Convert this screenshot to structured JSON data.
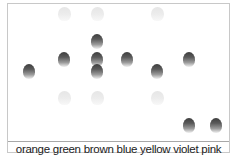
{
  "columns": [
    {
      "label": "orange",
      "x": 29
    },
    {
      "label": "green",
      "x": 64
    },
    {
      "label": "brown",
      "x": 97
    },
    {
      "label": "blue",
      "x": 127
    },
    {
      "label": "yellow",
      "x": 157
    },
    {
      "label": "violet",
      "x": 189
    },
    {
      "label": "pink",
      "x": 216
    }
  ],
  "balls": [
    {
      "column": "orange",
      "x": 29,
      "y": 71,
      "type": "solid"
    },
    {
      "column": "green",
      "x": 64,
      "y": 14,
      "type": "ghost"
    },
    {
      "column": "green",
      "x": 64,
      "y": 59,
      "type": "solid"
    },
    {
      "column": "green",
      "x": 64,
      "y": 98,
      "type": "ghost"
    },
    {
      "column": "brown",
      "x": 97,
      "y": 14,
      "type": "ghost"
    },
    {
      "column": "brown",
      "x": 97,
      "y": 41,
      "type": "solid"
    },
    {
      "column": "brown",
      "x": 97,
      "y": 59,
      "type": "solid"
    },
    {
      "column": "brown",
      "x": 97,
      "y": 71,
      "type": "solid"
    },
    {
      "column": "brown",
      "x": 97,
      "y": 98,
      "type": "ghost"
    },
    {
      "column": "blue",
      "x": 127,
      "y": 59,
      "type": "solid"
    },
    {
      "column": "yellow",
      "x": 157,
      "y": 14,
      "type": "ghost"
    },
    {
      "column": "yellow",
      "x": 157,
      "y": 71,
      "type": "solid"
    },
    {
      "column": "yellow",
      "x": 157,
      "y": 98,
      "type": "ghost"
    },
    {
      "column": "violet",
      "x": 189,
      "y": 59,
      "type": "solid"
    },
    {
      "column": "violet",
      "x": 189,
      "y": 125,
      "type": "solid"
    },
    {
      "column": "pink",
      "x": 216,
      "y": 125,
      "type": "solid"
    }
  ],
  "colors": {
    "border": "#c8c8c8",
    "ball_dark": "#3e3e3e",
    "ghost": "#e6e6e6",
    "text": "#222222"
  }
}
